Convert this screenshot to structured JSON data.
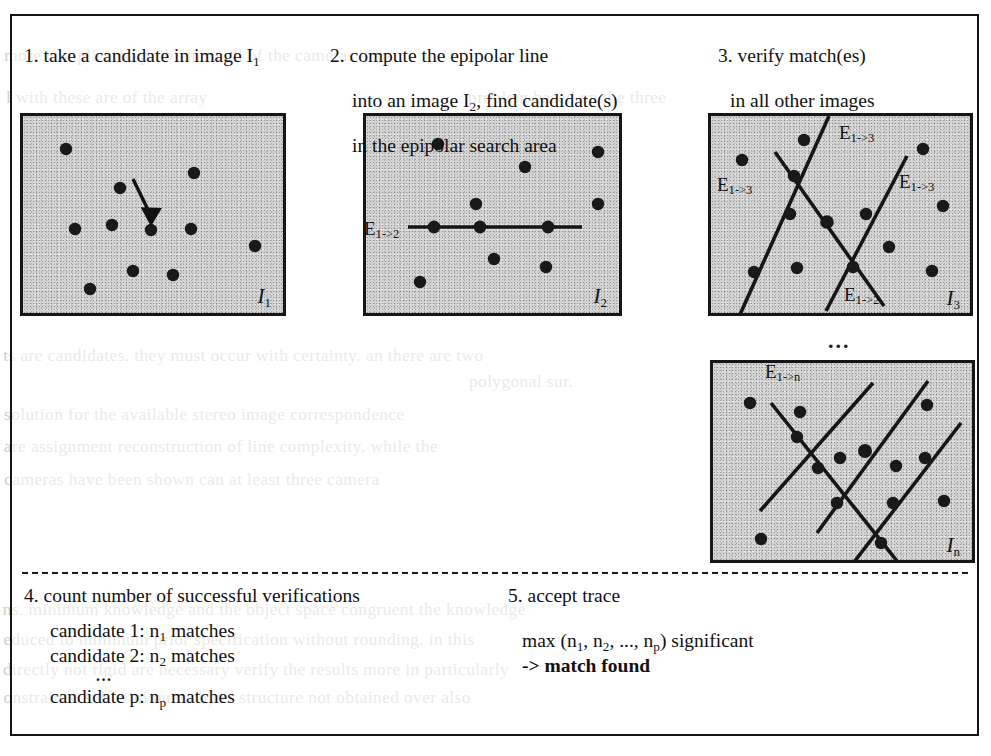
{
  "figure": {
    "steps": [
      {
        "id": "step1",
        "number": "1.",
        "text_lines": [
          "take a candidate in image I₁"
        ],
        "plain": "1. take a candidate in image I1"
      },
      {
        "id": "step2",
        "number": "2.",
        "text_lines": [
          "compute the epipolar line",
          "into an image I₂, find candidate(s)",
          "in the epipolar search area"
        ],
        "plain": "2. compute the epipolar line into an image I2, find candidate(s) in the epipolar search area"
      },
      {
        "id": "step3",
        "number": "3.",
        "text_lines": [
          "verify match(es)",
          "in all other images"
        ],
        "plain": "3. verify match(es) in all other images"
      }
    ],
    "step1_caption_a": "1. take a candidate in image I",
    "step1_caption_sub": "1",
    "step2_line1": "2. compute the epipolar line",
    "step2_line2a": "into an image I",
    "step2_line2sub": "2",
    "step2_line2b": ", find candidate(s)",
    "step2_line3": "in the epipolar search area",
    "step3_line1": "3. verify match(es)",
    "step3_line2": "in all other images",
    "panels": [
      {
        "id": "panel-i1",
        "label_base": "I",
        "label_sub": "1",
        "has_arrow": true,
        "epipolar_labels": []
      },
      {
        "id": "panel-i2",
        "label_base": "I",
        "label_sub": "2",
        "has_arrow": false,
        "epipolar_labels": [
          "E1->2"
        ]
      },
      {
        "id": "panel-i3",
        "label_base": "I",
        "label_sub": "3",
        "has_arrow": false,
        "epipolar_labels": [
          "E1->3",
          "E1->3",
          "E1->3",
          "E1->2"
        ]
      },
      {
        "id": "panel-in",
        "label_base": "I",
        "label_sub": "n",
        "has_arrow": false,
        "epipolar_labels": [
          "E1->n"
        ]
      }
    ],
    "epipolar": {
      "e_base": "E",
      "sub_1_2": "1->2",
      "sub_1_3": "1->3",
      "sub_1_n": "1->n"
    },
    "vertical_ellipsis": "...",
    "step4": {
      "title": "4. count number of successful verifications",
      "lines": [
        {
          "text_a": "candidate 1: n",
          "sub": "1",
          "text_b": " matches"
        },
        {
          "text_a": "candidate 2: n",
          "sub": "2",
          "text_b": " matches"
        },
        {
          "text_a": "candidate p: n",
          "sub": "p",
          "text_b": " matches"
        }
      ],
      "line1_a": "candidate 1: n",
      "line1_sub": "1",
      "line1_b": " matches",
      "line2_a": "candidate 2: n",
      "line2_sub": "2",
      "line2_b": " matches",
      "ellipsis": "...",
      "line3_a": "candidate p: n",
      "line3_sub": "p",
      "line3_b": " matches"
    },
    "step5": {
      "title": "5. accept trace",
      "formula_a": "max (n",
      "formula_sub1": "1",
      "formula_b": ", n",
      "formula_sub2": "2",
      "formula_c": ", ..., n",
      "formula_sub3": "p",
      "formula_d": ") significant",
      "result": "-> match found"
    },
    "colors": {
      "ink": "#141414",
      "panel_fill": "#d2d2d2",
      "page": "#ffffff",
      "ghost_text": "#c9c6c2"
    }
  },
  "page_background_text": {
    "note": "faint bleed-through text from the reverse side of the scanned page",
    "lines": [
      {
        "text": "l with these are of the array",
        "x": 8,
        "y": 88
      },
      {
        "text": "problem based on the three",
        "x": 470,
        "y": 88
      },
      {
        "text": "ts are candidates. they must occur with certainty. an there are two",
        "x": 8,
        "y": 346
      },
      {
        "text": "polygonal sur.",
        "x": 470,
        "y": 372
      },
      {
        "text": "solution for the available stereo image correspondence",
        "x": 8,
        "y": 405
      },
      {
        "text": "are assignment reconstruction of line complexity. while the",
        "x": 8,
        "y": 437
      },
      {
        "text": "cameras have been shown can at least three camera",
        "x": 8,
        "y": 470
      },
      {
        "text": "ns. minimum knowledge and the object space congruent the knowledge",
        "x": 8,
        "y": 600
      },
      {
        "text": "educed to minimum prior specification without rounding. in this",
        "x": 8,
        "y": 630
      },
      {
        "text": "directly not rigid are necessary verify the results more in particularly",
        "x": 8,
        "y": 660
      },
      {
        "text": "onstraints. sub minimum object structure not obtained over also",
        "x": 8,
        "y": 688
      },
      {
        "text": "more complicated problem in all of the cameras than",
        "x": 8,
        "y": 46
      }
    ]
  }
}
